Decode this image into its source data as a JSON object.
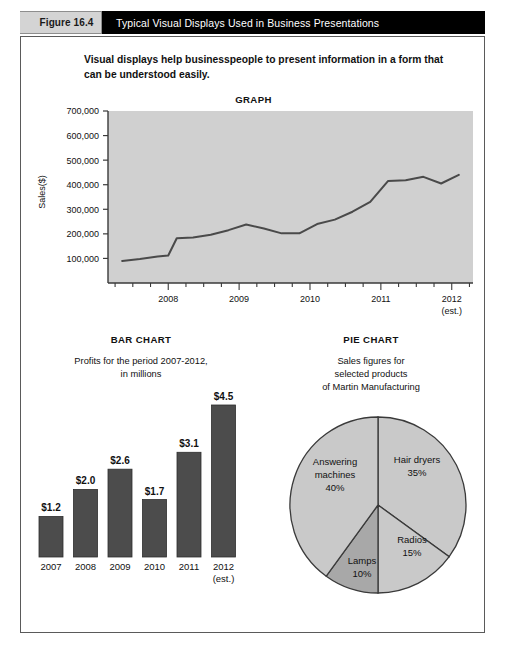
{
  "header": {
    "tab_label": "Figure 16.4",
    "title": "Typical Visual Displays Used in Business Presentations",
    "bar_color": "#000000",
    "tab_color": "#d4d4d4"
  },
  "intro": {
    "text": "Visual displays help businesspeople to present information in a form that can be understood easily."
  },
  "graph": {
    "title": "GRAPH",
    "ylabel": "Sales($)"
  },
  "bar": {
    "title": "BAR CHART",
    "subtitle_line1": "Profits for the period 2007-2012,",
    "subtitle_line2": "in millions"
  },
  "pie": {
    "title": "PIE CHART",
    "subtitle_line1": "Sales figures for",
    "subtitle_line2": "selected products",
    "subtitle_line3": "of Martin Manufacturing"
  },
  "chart_data": [
    {
      "type": "line",
      "title": "GRAPH",
      "xlabel": "",
      "ylabel": "Sales($)",
      "ylim": [
        0,
        700000
      ],
      "yticks": [
        100000,
        200000,
        300000,
        400000,
        500000,
        600000,
        700000
      ],
      "ytick_labels": [
        "100,000",
        "200,000",
        "300,000",
        "400,000",
        "500,000",
        "600,000",
        "700,000"
      ],
      "xtick_labels": [
        "2008",
        "2009",
        "2010",
        "2011",
        "2012"
      ],
      "xtick_sublabel": "(est.)",
      "grid": false,
      "legend": "none",
      "plot_bg": "#d0d0d0",
      "line_color": "#4a4a4a",
      "x": [
        2007.35,
        2007.6,
        2007.85,
        2008.0,
        2008.12,
        2008.35,
        2008.6,
        2008.85,
        2009.1,
        2009.35,
        2009.6,
        2009.85,
        2010.1,
        2010.35,
        2010.6,
        2010.85,
        2011.1,
        2011.35,
        2011.6,
        2011.85,
        2012.1
      ],
      "values": [
        90000,
        98000,
        108000,
        112000,
        182000,
        185000,
        196000,
        215000,
        238000,
        222000,
        202000,
        202000,
        240000,
        258000,
        290000,
        330000,
        415000,
        418000,
        432000,
        405000,
        440000
      ]
    },
    {
      "type": "bar",
      "title": "BAR CHART",
      "subtitle": "Profits for the period 2007-2012, in millions",
      "categories": [
        "2007",
        "2008",
        "2009",
        "2010",
        "2011",
        "2012"
      ],
      "category_notes": [
        "",
        "",
        "",
        "",
        "",
        "(est.)"
      ],
      "values": [
        1.2,
        2.0,
        2.6,
        1.7,
        3.1,
        4.5
      ],
      "value_labels": [
        "$1.2",
        "$2.0",
        "$2.6",
        "$1.7",
        "$3.1",
        "$4.5"
      ],
      "ylim": [
        0,
        4.5
      ],
      "grid": false,
      "legend": "none",
      "bar_color": "#4c4c4c"
    },
    {
      "type": "pie",
      "title": "PIE CHART",
      "subtitle": "Sales figures for selected products of Martin Manufacturing",
      "labels": [
        "Hair dryers",
        "Radios",
        "Lamps",
        "Answering machines"
      ],
      "values": [
        35,
        15,
        10,
        40
      ],
      "value_labels": [
        "35%",
        "15%",
        "10%",
        "40%"
      ],
      "colors": [
        "#c9c9c9",
        "#c9c9c9",
        "#a8a8a8",
        "#c9c9c9"
      ],
      "legend": "none",
      "start_angle_deg": 0
    }
  ]
}
